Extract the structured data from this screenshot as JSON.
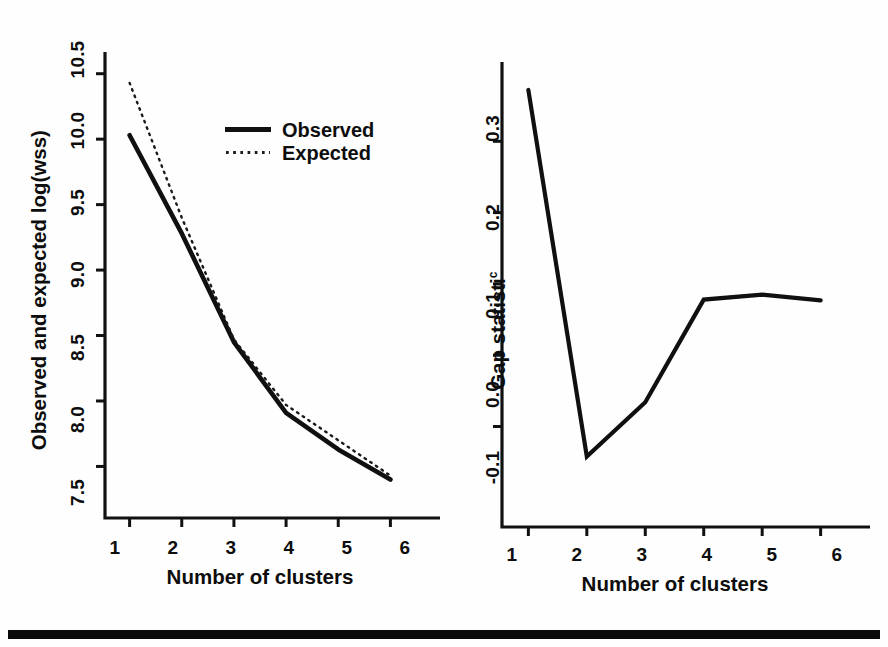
{
  "figure": {
    "background_color": "#fefefe",
    "ink_color": "#101010",
    "rule": {
      "name": "horizontal-rule",
      "color": "#0a0a0a"
    }
  },
  "legend": {
    "position": "top-center-left-panel",
    "entries": [
      {
        "label": "Observed",
        "style": "solid"
      },
      {
        "label": "Expected",
        "style": "dotted"
      }
    ]
  },
  "chart_data": [
    {
      "type": "line",
      "panel": "left",
      "title": "",
      "xlabel": "Number of clusters",
      "ylabel": "Observed and expected log(wss)",
      "x": [
        1,
        2,
        3,
        4,
        5,
        6
      ],
      "xticklabels": [
        "1",
        "2",
        "3",
        "4",
        "5",
        "6"
      ],
      "yticklabels": [
        "7.5",
        "8.0",
        "8.5",
        "9.0",
        "9.5",
        "10.0",
        "10.5"
      ],
      "yticks": [
        7.5,
        8.0,
        8.5,
        9.0,
        9.5,
        10.0,
        10.5
      ],
      "xlim": [
        0.72,
        6.28
      ],
      "ylim": [
        7.32,
        10.62
      ],
      "grid": false,
      "legend": "inside-top-right",
      "series": [
        {
          "name": "Observed",
          "style": "solid",
          "values": [
            10.03,
            9.28,
            8.45,
            7.91,
            7.63,
            7.4
          ]
        },
        {
          "name": "Expected",
          "style": "dotted",
          "values": [
            10.43,
            9.4,
            8.47,
            7.97,
            7.7,
            7.43
          ]
        }
      ]
    },
    {
      "type": "line",
      "panel": "right",
      "title": "",
      "xlabel": "Number of clusters",
      "ylabel": "Gap statisti",
      "ylabel_subscript": "c",
      "x": [
        1,
        2,
        3,
        4,
        5,
        6
      ],
      "xticklabels": [
        "1",
        "2",
        "3",
        "4",
        "5",
        "6"
      ],
      "yticklabels": [
        "-0.1",
        "0.0",
        "0.1",
        "0.2",
        "0.3"
      ],
      "yticks": [
        -0.1,
        0.0,
        0.1,
        0.2,
        0.3
      ],
      "xlim": [
        0.72,
        6.28
      ],
      "ylim": [
        -0.175,
        0.4
      ],
      "grid": false,
      "series": [
        {
          "name": "Gap statistic",
          "style": "solid",
          "values": [
            0.372,
            -0.142,
            -0.066,
            0.078,
            0.085,
            0.077
          ]
        }
      ]
    }
  ]
}
